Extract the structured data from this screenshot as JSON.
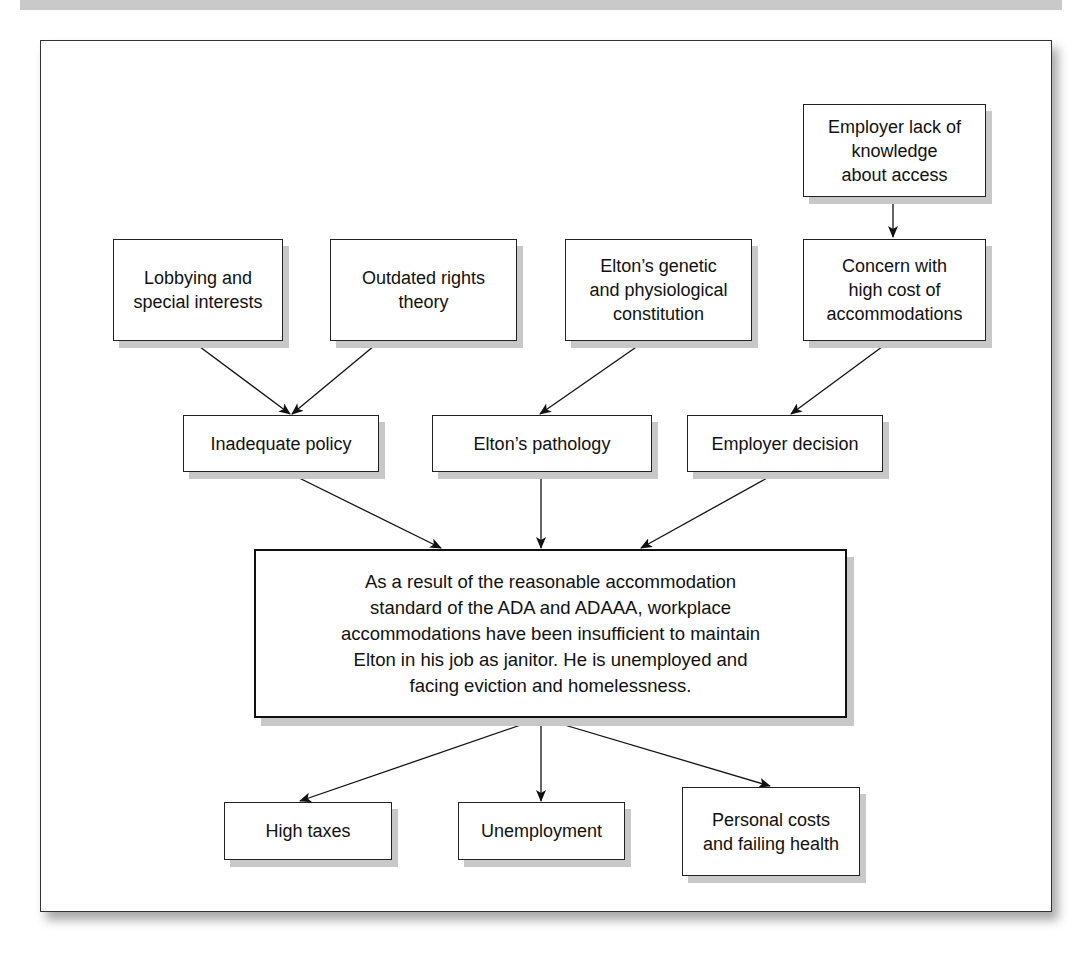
{
  "diagram": {
    "type": "problem-tree",
    "root_causes": [
      {
        "id": "employer_lack",
        "label": "Employer lack of\nknowledge\nabout access"
      }
    ],
    "contributing_factors": [
      {
        "id": "lobbying",
        "label": "Lobbying and\nspecial interests"
      },
      {
        "id": "outdated",
        "label": "Outdated rights\ntheory"
      },
      {
        "id": "genetic",
        "label": "Elton’s genetic\nand physiological\nconstitution"
      },
      {
        "id": "concern",
        "label": "Concern with\nhigh cost of\naccommodations"
      }
    ],
    "intermediate_causes": [
      {
        "id": "inadequate",
        "label": "Inadequate policy"
      },
      {
        "id": "pathology",
        "label": "Elton’s pathology"
      },
      {
        "id": "employer_decision",
        "label": "Employer decision"
      }
    ],
    "central_problem": {
      "id": "center",
      "label": "As a result of the reasonable accommodation\nstandard of the ADA and ADAAA, workplace\naccommodations have been insufficient to maintain\nElton in his job as janitor. He is unemployed and\nfacing eviction and homelessness."
    },
    "consequences": [
      {
        "id": "taxes",
        "label": "High taxes"
      },
      {
        "id": "unemployment",
        "label": "Unemployment"
      },
      {
        "id": "personal",
        "label": "Personal costs\nand failing health"
      }
    ],
    "edges": [
      [
        "employer_lack",
        "concern"
      ],
      [
        "lobbying",
        "inadequate"
      ],
      [
        "outdated",
        "inadequate"
      ],
      [
        "genetic",
        "pathology"
      ],
      [
        "concern",
        "employer_decision"
      ],
      [
        "inadequate",
        "center"
      ],
      [
        "pathology",
        "center"
      ],
      [
        "employer_decision",
        "center"
      ],
      [
        "center",
        "taxes"
      ],
      [
        "center",
        "unemployment"
      ],
      [
        "center",
        "personal"
      ]
    ]
  },
  "colors": {
    "box_border": "#222222",
    "shadow": "#c8c8c8",
    "background": "#ffffff",
    "text": "#111111"
  }
}
